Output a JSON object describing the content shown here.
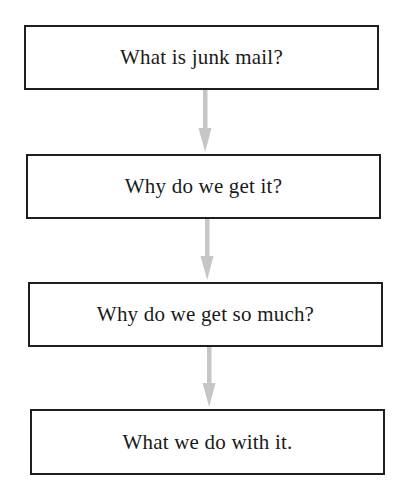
{
  "diagram": {
    "type": "flowchart",
    "direction": "top-to-bottom",
    "nodes": [
      {
        "id": "n1",
        "label": "What is junk mail?"
      },
      {
        "id": "n2",
        "label": "Why do we get it?"
      },
      {
        "id": "n3",
        "label": "Why do we get so much?"
      },
      {
        "id": "n4",
        "label": "What we do with it."
      }
    ],
    "edges": [
      {
        "from": "n1",
        "to": "n2"
      },
      {
        "from": "n2",
        "to": "n3"
      },
      {
        "from": "n3",
        "to": "n4"
      }
    ],
    "colors": {
      "box_border": "#1e1e1e",
      "text": "#1a1a1a",
      "arrow": "#c6c6c6",
      "background": "#ffffff"
    }
  }
}
